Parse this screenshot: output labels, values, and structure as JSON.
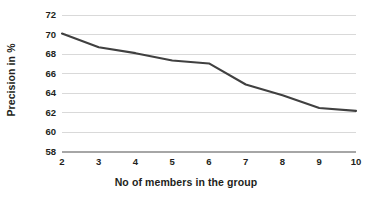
{
  "chart_data": {
    "type": "line",
    "title": "",
    "xlabel": "No of members in the group",
    "ylabel": "Precision in %",
    "x": [
      2,
      3,
      4,
      5,
      6,
      7,
      8,
      9,
      10
    ],
    "categories": [
      "2",
      "3",
      "4",
      "5",
      "6",
      "7",
      "8",
      "9",
      "10"
    ],
    "series": [
      {
        "name": "Precision",
        "values": [
          70.1,
          68.7,
          68.1,
          67.35,
          67.05,
          64.9,
          63.8,
          62.5,
          62.2
        ],
        "color": "#404040"
      }
    ],
    "xlim": [
      2,
      10
    ],
    "ylim": [
      58,
      72
    ],
    "ytick_labels": [
      "58",
      "60",
      "62",
      "64",
      "66",
      "68",
      "70",
      "72"
    ],
    "ytick_values": [
      58,
      60,
      62,
      64,
      66,
      68,
      70,
      72
    ],
    "xtick_labels": [
      "2",
      "3",
      "4",
      "5",
      "6",
      "7",
      "8",
      "9",
      "10"
    ],
    "grid": {
      "horizontal": true,
      "vertical": false,
      "color": "#d9d9d9"
    },
    "axis_line_color": "#a6a6a6",
    "legend": null,
    "legend_position": "none",
    "background": "#ffffff",
    "text_color": "#231f20"
  }
}
